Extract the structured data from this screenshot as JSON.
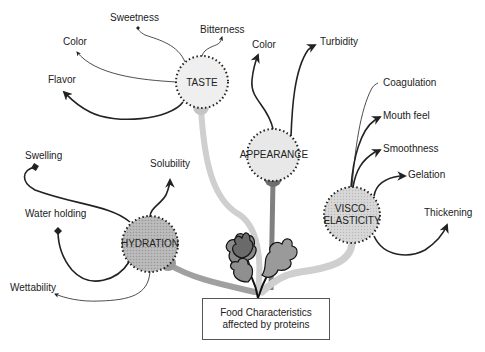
{
  "title": "Food Characteristics affected by proteins",
  "center": {
    "line1": "Food Characteristics",
    "line2": "affected by proteins"
  },
  "nodes": {
    "taste": {
      "label": "TASTE",
      "attributes": [
        "Sweetness",
        "Bitterness",
        "Color",
        "Flavor"
      ]
    },
    "appearance": {
      "label": "APPEARANCE",
      "attributes": [
        "Color",
        "Turbidity"
      ]
    },
    "visco": {
      "label_line1": "VISCO-",
      "label_line2": "ELASTICITY",
      "attributes": [
        "Coagulation",
        "Mouth feel",
        "Smoothness",
        "Gelation",
        "Thickening"
      ]
    },
    "hydration": {
      "label": "HYDRATION",
      "attributes": [
        "Swelling",
        "Solubility",
        "Water holding",
        "Wettability"
      ]
    }
  },
  "colors": {
    "circle_fill_light": "#e6e6e6",
    "circle_fill_mid": "#bdbdbd",
    "stem_light": "#cfcfcf",
    "stem_dark": "#7a7a7a",
    "stem_mid": "#a8a8a8",
    "line": "#222222"
  }
}
